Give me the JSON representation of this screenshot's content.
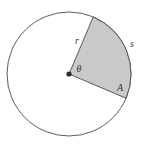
{
  "figure": {
    "type": "circle-sector-diagram",
    "background_color": "#ffffff",
    "circle": {
      "center_x": 69,
      "center_y": 74,
      "radius": 62,
      "stroke_color": "#4a4a4a",
      "stroke_width": 0.9,
      "fill_color": "#ffffff"
    },
    "sector": {
      "fill_color": "#c9c9c9",
      "stroke_color": "#4a4a4a",
      "stroke_width": 0.9,
      "start_angle_deg": -67,
      "end_angle_deg": 23,
      "central_angle_deg": 90
    },
    "center_dot": {
      "radius": 2.6,
      "color": "#2b2b2b"
    },
    "labels": {
      "radius": {
        "text": "r",
        "x": 77,
        "y": 41
      },
      "arc": {
        "text": "s",
        "x": 132,
        "y": 44
      },
      "angle": {
        "text": "θ",
        "x": 79,
        "y": 69
      },
      "area": {
        "text": "A",
        "x": 120,
        "y": 88
      }
    }
  }
}
